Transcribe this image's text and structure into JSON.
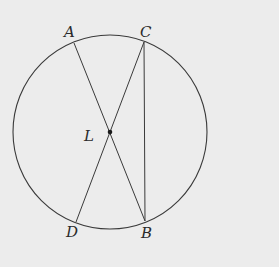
{
  "diagram": {
    "type": "circle-with-chords",
    "background": "#ececec",
    "stroke_color": "#3a3a3a",
    "circle": {
      "cx": 110,
      "cy": 132,
      "r": 97
    },
    "center_point": {
      "name": "L",
      "x": 110,
      "y": 132
    },
    "points": {
      "A": {
        "x": 74,
        "y": 43
      },
      "C": {
        "x": 144,
        "y": 42
      },
      "D": {
        "x": 76,
        "y": 222
      },
      "B": {
        "x": 145,
        "y": 221
      }
    },
    "segments": [
      {
        "from": "A",
        "to": "B"
      },
      {
        "from": "C",
        "to": "D"
      },
      {
        "from": "C",
        "to": "B"
      }
    ],
    "labels": {
      "A": "A",
      "C": "C",
      "L": "L",
      "D": "D",
      "B": "B"
    }
  }
}
